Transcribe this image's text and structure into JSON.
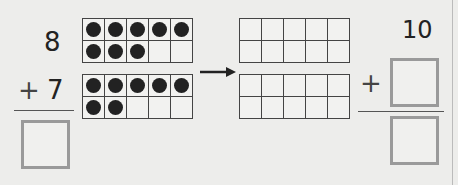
{
  "problem": {
    "addend1": "8",
    "plus": "+",
    "addend2": "7",
    "ten": "10",
    "frames_left": [
      {
        "filled": 8,
        "total": 10
      },
      {
        "filled": 7,
        "total": 10
      }
    ],
    "frames_right": [
      {
        "filled": 0,
        "total": 10
      },
      {
        "filled": 0,
        "total": 10
      }
    ],
    "arrow": "→"
  }
}
